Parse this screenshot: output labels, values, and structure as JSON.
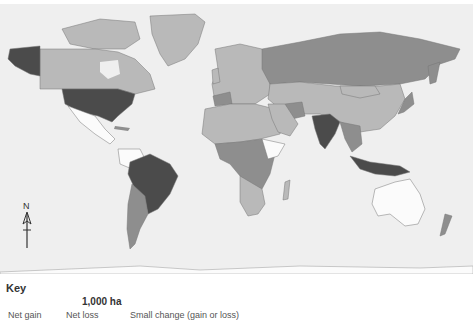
{
  "map": {
    "colors": {
      "ocean": "#efefef",
      "no_data": "#fbfbfb",
      "small_change": "#b9b9b9",
      "net_loss": "#8e8e8e",
      "net_gain": "#4b4b4b",
      "border": "#777777"
    },
    "compass": {
      "label": "N"
    },
    "regions": [
      {
        "name": "Alaska",
        "class": "net_gain"
      },
      {
        "name": "Canada",
        "class": "small_change"
      },
      {
        "name": "Greenland",
        "class": "small_change"
      },
      {
        "name": "United States",
        "class": "net_gain"
      },
      {
        "name": "Mexico",
        "class": "no_data"
      },
      {
        "name": "Brazil",
        "class": "net_gain"
      },
      {
        "name": "Argentina",
        "class": "net_loss"
      },
      {
        "name": "Europe",
        "class": "small_change"
      },
      {
        "name": "Russia",
        "class": "net_loss"
      },
      {
        "name": "China",
        "class": "small_change"
      },
      {
        "name": "India",
        "class": "net_gain"
      },
      {
        "name": "Africa",
        "class": "small_change"
      },
      {
        "name": "Australia",
        "class": "no_data"
      },
      {
        "name": "Indonesia",
        "class": "net_gain"
      },
      {
        "name": "New Zealand",
        "class": "net_loss"
      }
    ]
  },
  "key": {
    "title": "Key",
    "unit": "1,000 ha",
    "labels": [
      "Net gain",
      "Net loss",
      "Small change (gain or loss)"
    ]
  }
}
